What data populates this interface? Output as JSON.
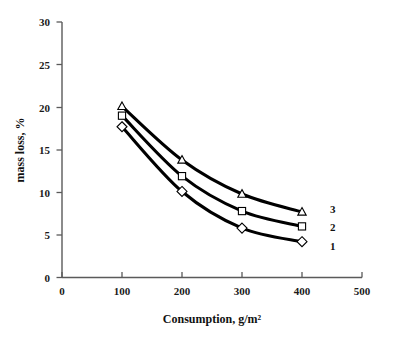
{
  "chart_data": {
    "type": "line",
    "title": "",
    "xlabel": "Consumption, g/m²",
    "ylabel": "mass loss, %",
    "xlim": [
      0,
      500
    ],
    "ylim": [
      0,
      30
    ],
    "xticks": [
      "0",
      "100",
      "200",
      "300",
      "400",
      "500"
    ],
    "yticks": [
      "0",
      "5",
      "10",
      "15",
      "20",
      "25",
      "30"
    ],
    "grid": false,
    "legend_position": "right-inline",
    "x": [
      100,
      200,
      300,
      400
    ],
    "series": [
      {
        "name": "1",
        "marker": "diamond",
        "values": [
          17.7,
          10.1,
          5.8,
          4.2
        ]
      },
      {
        "name": "2",
        "marker": "square",
        "values": [
          19.0,
          11.9,
          7.8,
          6.0
        ]
      },
      {
        "name": "3",
        "marker": "triangle",
        "values": [
          20.1,
          13.8,
          9.8,
          7.7
        ]
      }
    ],
    "annotations": [
      {
        "text": "3",
        "for_series": "3"
      },
      {
        "text": "2",
        "for_series": "2"
      },
      {
        "text": "1",
        "for_series": "1"
      }
    ],
    "colors": {
      "curve": "#000000",
      "axis": "#5a5a5a",
      "text": "#111111",
      "marker_fill": "#ffffff"
    }
  }
}
